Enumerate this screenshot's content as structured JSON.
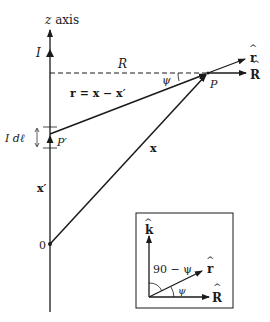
{
  "diagram": {
    "type": "vector-geometry",
    "axis": {
      "label": "z axis"
    },
    "current_label": "I",
    "dashed_line_label": "R",
    "angle_label": "ψ",
    "point_P": "P",
    "point_P_prime": "P′",
    "current_element_label": "I dℓ",
    "vector_r_label": "r = x − x′",
    "vector_x_label": "x",
    "vector_x_prime_label": "x′",
    "origin_label": "0",
    "unit_r_label": "r",
    "unit_R_label": "R",
    "hat": "^",
    "inset": {
      "unit_k_label": "k",
      "unit_r_label": "r",
      "unit_R_label": "R",
      "complement_angle_label": "90 − ψ",
      "angle_label": "ψ",
      "hat": "^"
    },
    "colors": {
      "ink": "#1a1a1a",
      "background": "#ffffff"
    }
  }
}
